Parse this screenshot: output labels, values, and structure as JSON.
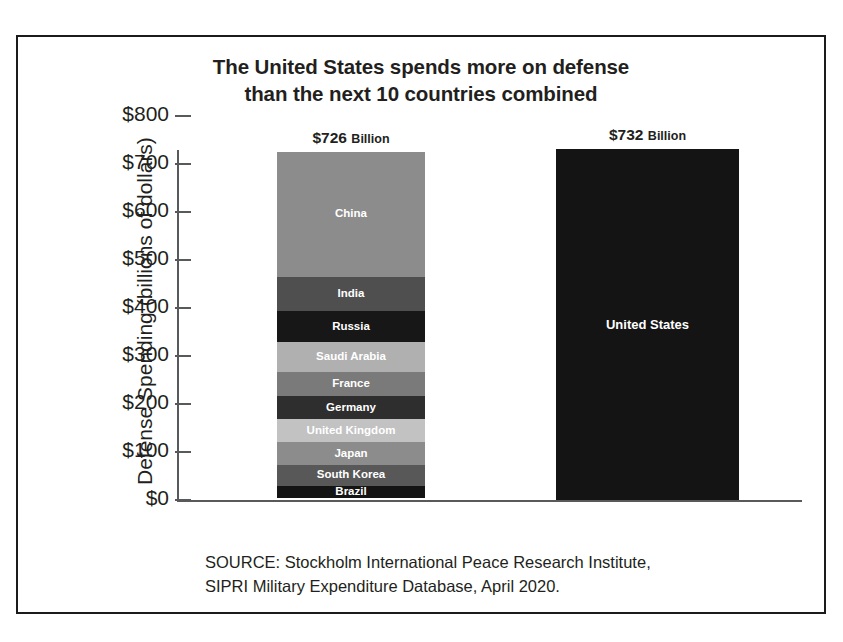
{
  "title": {
    "line1": "The United States spends more on defense",
    "line2": "than the next 10 countries combined"
  },
  "source": {
    "line1": "SOURCE: Stockholm International Peace Research Institute,",
    "line2": "SIPRI Military Expenditure Database, April 2020."
  },
  "axis": {
    "y_title": "Defense Spending (billions of dollars)",
    "y_ticks": [
      "$800",
      "$700",
      "$600",
      "$500",
      "$400",
      "$300",
      "$200",
      "$100",
      "$0"
    ]
  },
  "bars": {
    "stack": {
      "total_amount": "$726",
      "total_unit": "Billion"
    },
    "us": {
      "total_amount": "$732",
      "total_unit": "Billion"
    }
  },
  "chart_data": {
    "type": "bar",
    "subtype": "stacked-vs-single",
    "title": "The United States spends more on defense than the next 10 countries combined",
    "xlabel": "",
    "ylabel": "Defense Spending (billions of dollars)",
    "ylim": [
      0,
      800
    ],
    "ytick_step": 100,
    "yticks": [
      0,
      100,
      200,
      300,
      400,
      500,
      600,
      700,
      800
    ],
    "grid": false,
    "legend": "none (in-segment labels)",
    "units": "billions of US dollars",
    "source": "SOURCE: Stockholm International Peace Research Institute, SIPRI Military Expenditure Database, April 2020.",
    "categories": [
      "Next 10 countries combined",
      "United States"
    ],
    "totals": [
      726,
      732
    ],
    "total_labels": [
      "$726 Billion",
      "$732 Billion"
    ],
    "segments": [
      {
        "name": "China",
        "value": 261,
        "color": "#8c8c8c"
      },
      {
        "name": "India",
        "value": 71,
        "color": "#4f4f4f"
      },
      {
        "name": "Russia",
        "value": 65,
        "color": "#171717"
      },
      {
        "name": "Saudi Arabia",
        "value": 62,
        "color": "#b0b0b0"
      },
      {
        "name": "France",
        "value": 50,
        "color": "#7a7a7a"
      },
      {
        "name": "Germany",
        "value": 49,
        "color": "#2e2e2e"
      },
      {
        "name": "United Kingdom",
        "value": 48,
        "color": "#c2c2c2"
      },
      {
        "name": "Japan",
        "value": 47,
        "color": "#8c8c8c"
      },
      {
        "name": "South Korea",
        "value": 43,
        "color": "#585858"
      },
      {
        "name": "Brazil",
        "value": 26,
        "color": "#141414"
      }
    ],
    "us_bar": {
      "name": "United States",
      "value": 732,
      "color": "#141414"
    }
  }
}
